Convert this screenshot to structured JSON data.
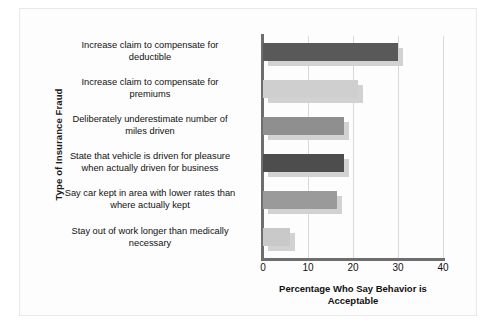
{
  "chart_data": {
    "type": "bar",
    "orientation": "horizontal",
    "title": "",
    "xlabel": "Percentage Who Say Behavior is Acceptable",
    "ylabel": "Type of Insurance Fraud",
    "xlim": [
      0,
      40
    ],
    "xticks": [
      "0",
      "10",
      "20",
      "30",
      "40"
    ],
    "grid": true,
    "legend": "none",
    "categories": [
      "Increase claim to compensate for deductible",
      "Increase claim to compensate for premiums",
      "Deliberately underestimate number of miles driven",
      "State that vehicle is driven for pleasure when actually driven for business",
      "Say car kept in area with lower rates than where actually kept",
      "Stay out of work longer than medically necessary"
    ],
    "values": [
      30,
      21,
      18,
      18,
      16.5,
      6
    ],
    "bar_colors": [
      "#595959",
      "#cfcfcf",
      "#8f8f8f",
      "#4d4d4d",
      "#9a9a9a",
      "#c9c9c9"
    ],
    "shadow_color": "#d2d2d2",
    "axis_color": "#6e6e6e",
    "grid_color": "#d9d9d9",
    "background": "#fdfdfd"
  },
  "axis": {
    "y_title": "Type of Insurance Fraud",
    "x_title_line1": "Percentage Who Say Behavior is",
    "x_title_line2": "Acceptable"
  },
  "categories_display": [
    {
      "line1": "Increase claim to compensate for",
      "line2": "deductible"
    },
    {
      "line1": "Increase claim to compensate for",
      "line2": "premiums"
    },
    {
      "line1": "Deliberately underestimate number of",
      "line2": "miles driven"
    },
    {
      "line1": "State that vehicle is driven for pleasure",
      "line2": "when actually driven for business"
    },
    {
      "line1": "Say car kept in area with lower rates than",
      "line2": "where actually kept"
    },
    {
      "line1": "Stay out of work longer than medically",
      "line2": "necessary"
    }
  ],
  "ticks": [
    {
      "label": "0"
    },
    {
      "label": "10"
    },
    {
      "label": "20"
    },
    {
      "label": "30"
    },
    {
      "label": "40"
    }
  ]
}
